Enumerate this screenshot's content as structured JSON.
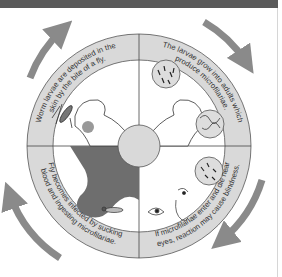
{
  "diagram": {
    "type": "life-cycle",
    "colors": {
      "ring": "#d9d9d9",
      "arrow": "#8a8a8a",
      "header": "#5a5a5a",
      "patient_dark": "#6e6e6e"
    },
    "stages": [
      {
        "id": "deposit",
        "text": "Worm larvae are deposited in the skin by the bite of a fly.",
        "line1": "Worm larvae are deposited in the",
        "line2": "skin by the bite of a fly."
      },
      {
        "id": "grow",
        "text": "The larvae grow into adults which produce microfilariae.",
        "line1": "The larvae grow into adults which",
        "line2": "produce microfilariae."
      },
      {
        "id": "eyes",
        "text": "If microfilariae enter and die near eyes, reaction may cause blindness.",
        "line1": "If microfilariae enter and die near",
        "line2": "eyes, reaction may cause blindness."
      },
      {
        "id": "infect",
        "text": "Fly becomes infected by sucking blood and ingesting microfilariae.",
        "line1": "Fly becomes infected by sucking",
        "line2": "blood and ingesting microfilariae."
      }
    ]
  }
}
